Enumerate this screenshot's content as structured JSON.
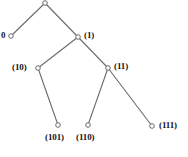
{
  "figure": {
    "width": 188,
    "height": 157,
    "background_color": "#ffffff",
    "stroke_color": "#6b6b6b",
    "label_color": "#151515",
    "caption_fragment": ""
  },
  "diagram": {
    "type": "binary-tree",
    "node_marker": "small-open-circle",
    "nodes": [
      {
        "id": "root",
        "label": "",
        "x": 45,
        "y": 3,
        "label_x": 0,
        "label_y": 0,
        "label_side": "none"
      },
      {
        "id": "n0",
        "label": "0",
        "x": 11,
        "y": 36,
        "label_x": 1,
        "label_y": 31,
        "label_side": "left"
      },
      {
        "id": "n1",
        "label": "(1)",
        "x": 78,
        "y": 37,
        "label_x": 84,
        "label_y": 31,
        "label_side": "right"
      },
      {
        "id": "n10",
        "label": "(10)",
        "x": 38,
        "y": 68,
        "label_x": 12,
        "label_y": 63,
        "label_side": "left"
      },
      {
        "id": "n11",
        "label": "(11)",
        "x": 108,
        "y": 68,
        "label_x": 114,
        "label_y": 62,
        "label_side": "right"
      },
      {
        "id": "n101",
        "label": "(101)",
        "x": 58,
        "y": 125,
        "label_x": 45,
        "label_y": 133,
        "label_side": "below"
      },
      {
        "id": "n110",
        "label": "(110)",
        "x": 88,
        "y": 125,
        "label_x": 76,
        "label_y": 133,
        "label_side": "below"
      },
      {
        "id": "n111",
        "label": "(111)",
        "x": 152,
        "y": 126,
        "label_x": 159,
        "label_y": 121,
        "label_side": "right"
      }
    ],
    "edges": [
      {
        "id": "e-root-0",
        "from": "root",
        "to": "n0"
      },
      {
        "id": "e-root-1",
        "from": "root",
        "to": "n1"
      },
      {
        "id": "e-1-10",
        "from": "n1",
        "to": "n10"
      },
      {
        "id": "e-1-11",
        "from": "n1",
        "to": "n11"
      },
      {
        "id": "e-10-101",
        "from": "n10",
        "to": "n101"
      },
      {
        "id": "e-11-110",
        "from": "n11",
        "to": "n110"
      },
      {
        "id": "e-11-111",
        "from": "n11",
        "to": "n111"
      }
    ]
  }
}
